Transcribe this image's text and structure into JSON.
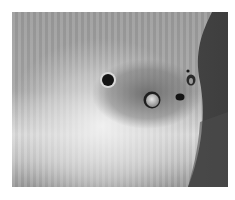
{
  "image": {
    "kind": "photograph",
    "alt": "Grayscale close-up of a striated plant stem surface with several bore holes and a darkened damaged area",
    "tones": {
      "background": "#ffffff",
      "stem_base": "#9a9a9a",
      "stem_highlight": "#e6e6e6",
      "damage_patch": "#6e6e6e",
      "shadow_right": "#4a4a4a",
      "hole_dark": "#111111",
      "hole_rim": "#d8d8d8",
      "plug": "#bdbdbd"
    },
    "features": [
      {
        "name": "bore-hole-large",
        "cx": 96,
        "cy": 68,
        "r": 7
      },
      {
        "name": "bore-hole-plugged",
        "cx": 140,
        "cy": 88,
        "r": 8
      },
      {
        "name": "bore-hole-small",
        "cx": 168,
        "cy": 85,
        "r": 4
      },
      {
        "name": "bore-hole-upper-right",
        "cx": 178,
        "cy": 66,
        "r": 5
      }
    ]
  }
}
